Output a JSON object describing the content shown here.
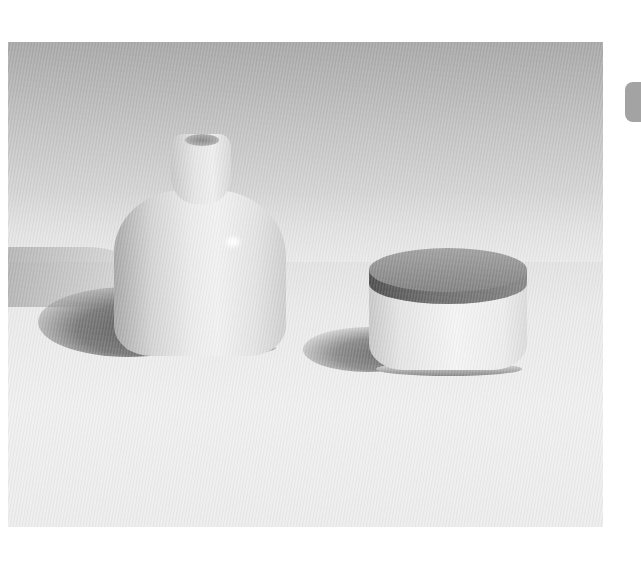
{
  "photo": {
    "subject": "white ceramic vase and lidded ceramic jar with dark wooden lid",
    "objects": [
      {
        "name": "vase",
        "description": "white ceramic bud vase"
      },
      {
        "name": "lidded-jar",
        "description": "white ceramic jar with dark lid"
      }
    ],
    "colors": {
      "background_top": "#a9a9a9",
      "background_bottom": "#ededed",
      "ceramic": "#ececec",
      "lid": "#8a8a8a",
      "shadow": "#6a6a6a"
    }
  },
  "side_tab": {
    "color": "#a3a3a3"
  }
}
